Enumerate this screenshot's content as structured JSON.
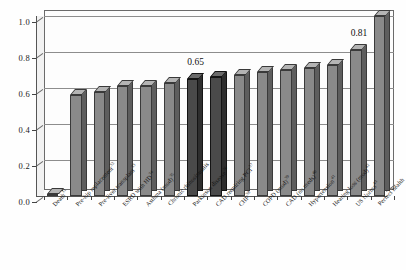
{
  "chart_data": {
    "type": "bar",
    "title": "",
    "subtitle": "",
    "xlabel": "",
    "ylabel": "",
    "ylim": [
      0.0,
      1.0
    ],
    "ytick_labels": [
      "0.0",
      "0.2",
      "0.4",
      "0.6",
      "0.8",
      "1.0"
    ],
    "ytick_values": [
      0.0,
      0.2,
      0.4,
      0.6,
      0.8,
      1.0
    ],
    "grid": true,
    "legend": "none",
    "style": "3d-bar-grayscale",
    "categories": [
      "Death",
      "Pre-hip replacement",
      "Pre-liver transplant",
      "ESRD with HD",
      "Asthma (mod)",
      "Chronic rhinosinusitis",
      "Parkinson disease",
      "CAD requiring PCI",
      "CHF",
      "COPD (mod)",
      "CAD (no meds)",
      "Hypertension",
      "Hearing loss (mod)",
      "US Norms",
      "Perfect health"
    ],
    "category_superscripts": [
      "31",
      "32",
      "33",
      "34",
      "35",
      "",
      "36",
      "37",
      "38",
      "39",
      "40",
      "41",
      "42",
      "43",
      ""
    ],
    "values": [
      0.0,
      0.56,
      0.58,
      0.61,
      0.61,
      0.63,
      0.65,
      0.66,
      0.67,
      0.69,
      0.7,
      0.71,
      0.73,
      0.81,
      1.0
    ],
    "highlighted_categories": [
      "Parkinson disease",
      "CAD requiring PCI"
    ],
    "annotations": [
      {
        "label": "0.65",
        "category": "Parkinson disease",
        "value": 0.65
      },
      {
        "label": "0.81",
        "category": "US Norms",
        "value": 0.81
      }
    ]
  },
  "colors": {
    "bar_face": "#8a8a8a",
    "bar_face_highlight": "#4a4a4a",
    "bar_top": "#b4b4b4",
    "bar_side": "#5e5e5e",
    "axis": "#555555",
    "gridline": "#8d8d8d",
    "text": "#141414",
    "background": "#ffffff"
  }
}
